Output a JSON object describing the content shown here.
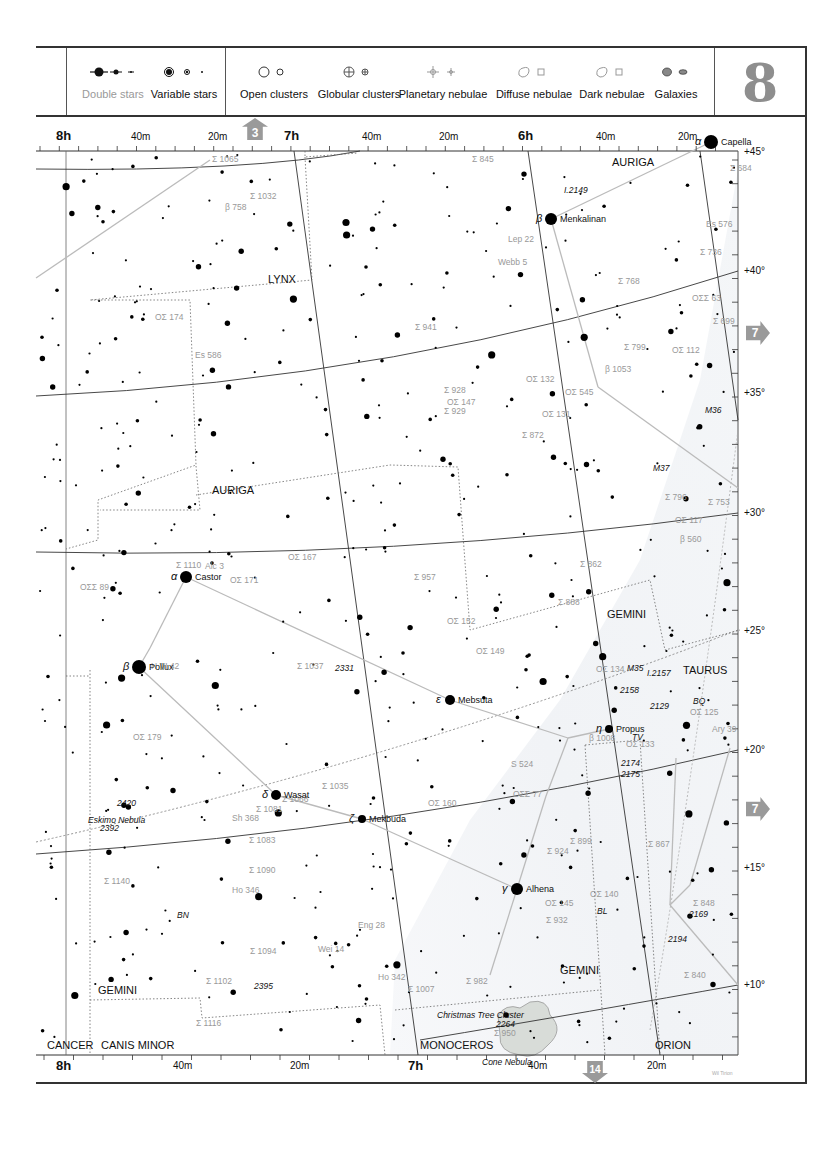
{
  "legend": {
    "items": [
      {
        "label": "Double stars",
        "muted": true,
        "icon": "double-star-icon"
      },
      {
        "label": "Variable stars",
        "muted": false,
        "icon": "variable-star-icon"
      },
      {
        "label": "Open clusters",
        "muted": false,
        "icon": "open-cluster-icon"
      },
      {
        "label": "Globular clusters",
        "muted": false,
        "icon": "globular-cluster-icon"
      },
      {
        "label": "Planetary nebulae",
        "muted": false,
        "icon": "planetary-nebula-icon"
      },
      {
        "label": "Diffuse nebulae",
        "muted": false,
        "icon": "diffuse-nebula-icon"
      },
      {
        "label": "Dark nebulae",
        "muted": false,
        "icon": "dark-nebula-icon"
      },
      {
        "label": "Galaxies",
        "muted": false,
        "icon": "galaxy-icon"
      }
    ],
    "chart_number": "8"
  },
  "navigation": {
    "up": "3",
    "right_top": "7",
    "right_bottom": "7",
    "down": "14"
  },
  "axes": {
    "top": [
      {
        "label": "8h",
        "type": "hour",
        "x": 66
      },
      {
        "label": "40m",
        "type": "minute",
        "x": 141
      },
      {
        "label": "20m",
        "type": "minute",
        "x": 218
      },
      {
        "label": "7h",
        "type": "hour",
        "x": 294
      },
      {
        "label": "40m",
        "type": "minute",
        "x": 372
      },
      {
        "label": "20m",
        "type": "minute",
        "x": 449
      },
      {
        "label": "6h",
        "type": "hour",
        "x": 528
      },
      {
        "label": "40m",
        "type": "minute",
        "x": 606
      },
      {
        "label": "20m",
        "type": "minute",
        "x": 688
      }
    ],
    "bottom": [
      {
        "label": "8h",
        "type": "hour",
        "x": 66
      },
      {
        "label": "40m",
        "type": "minute",
        "x": 183
      },
      {
        "label": "20m",
        "type": "minute",
        "x": 300
      },
      {
        "label": "7h",
        "type": "hour",
        "x": 418
      },
      {
        "label": "40m",
        "type": "minute",
        "x": 538
      },
      {
        "label": "20m",
        "type": "minute",
        "x": 657
      }
    ],
    "right": [
      {
        "label": "+45°",
        "y": 152
      },
      {
        "label": "+40°",
        "y": 271
      },
      {
        "label": "+35°",
        "y": 393
      },
      {
        "label": "+30°",
        "y": 513
      },
      {
        "label": "+25°",
        "y": 631
      },
      {
        "label": "+20°",
        "y": 750
      },
      {
        "label": "+15°",
        "y": 868
      },
      {
        "label": "+10°",
        "y": 985
      }
    ]
  },
  "constellations": [
    {
      "name": "AURIGA",
      "x": 612,
      "y": 162
    },
    {
      "name": "LYNX",
      "x": 268,
      "y": 279
    },
    {
      "name": "AURIGA",
      "x": 212,
      "y": 490
    },
    {
      "name": "GEMINI",
      "x": 607,
      "y": 614
    },
    {
      "name": "TAURUS",
      "x": 683,
      "y": 670
    },
    {
      "name": "GEMINI",
      "x": 560,
      "y": 970
    },
    {
      "name": "GEMINI",
      "x": 98,
      "y": 990
    },
    {
      "name": "CANCER",
      "x": 47,
      "y": 1045
    },
    {
      "name": "CANIS MINOR",
      "x": 101,
      "y": 1045
    },
    {
      "name": "MONOCEROS",
      "x": 420,
      "y": 1045
    },
    {
      "name": "ORION",
      "x": 655,
      "y": 1045
    }
  ],
  "named_stars": [
    {
      "name": "Capella",
      "greek": "α",
      "x": 711,
      "y": 142,
      "r": 7
    },
    {
      "name": "Menkalinan",
      "greek": "β",
      "x": 551,
      "y": 219,
      "r": 6
    },
    {
      "name": "Castor",
      "greek": "α",
      "x": 186,
      "y": 577,
      "r": 6
    },
    {
      "name": "Pollux",
      "greek": "β",
      "x": 139,
      "y": 667,
      "r": 7
    },
    {
      "name": "Mebsuta",
      "greek": "ε",
      "x": 450,
      "y": 700,
      "r": 5
    },
    {
      "name": "Propus",
      "greek": "η",
      "x": 609,
      "y": 729,
      "r": 4
    },
    {
      "name": "Wasat",
      "greek": "δ",
      "x": 276,
      "y": 795,
      "r": 5
    },
    {
      "name": "Mekbuda",
      "greek": "ζ",
      "x": 362,
      "y": 819,
      "r": 4
    },
    {
      "name": "Alhena",
      "greek": "γ",
      "x": 517,
      "y": 889,
      "r": 6
    }
  ],
  "labels": [
    {
      "t": "Σ 1065",
      "x": 212,
      "y": 160,
      "grey": true
    },
    {
      "t": "Σ 845",
      "x": 472,
      "y": 160,
      "grey": true
    },
    {
      "t": "Σ 684",
      "x": 730,
      "y": 169,
      "grey": true
    },
    {
      "t": "I.2149",
      "x": 564,
      "y": 191,
      "grey": false
    },
    {
      "t": "Σ 1032",
      "x": 250,
      "y": 197,
      "grey": true
    },
    {
      "t": "β 758",
      "x": 225,
      "y": 208,
      "grey": true
    },
    {
      "t": "Es 576",
      "x": 706,
      "y": 225,
      "grey": true
    },
    {
      "t": "Lep 22",
      "x": 508,
      "y": 240,
      "grey": true
    },
    {
      "t": "Σ 736",
      "x": 700,
      "y": 253,
      "grey": true
    },
    {
      "t": "Webb 5",
      "x": 498,
      "y": 263,
      "grey": true
    },
    {
      "t": "Σ 768",
      "x": 618,
      "y": 282,
      "grey": true
    },
    {
      "t": "ΟΣΣ 63",
      "x": 692,
      "y": 299,
      "grey": true
    },
    {
      "t": "ΟΣ 174",
      "x": 155,
      "y": 318,
      "grey": true
    },
    {
      "t": "Σ 699",
      "x": 713,
      "y": 322,
      "grey": true
    },
    {
      "t": "Σ 941",
      "x": 415,
      "y": 328,
      "grey": true
    },
    {
      "t": "Σ 799",
      "x": 624,
      "y": 348,
      "grey": true
    },
    {
      "t": "ΟΣ 112",
      "x": 672,
      "y": 351,
      "grey": true
    },
    {
      "t": "Es 586",
      "x": 195,
      "y": 356,
      "grey": true
    },
    {
      "t": "ΟΣ 132",
      "x": 526,
      "y": 380,
      "grey": true
    },
    {
      "t": "β 1053",
      "x": 605,
      "y": 370,
      "grey": true
    },
    {
      "t": "Σ 928",
      "x": 444,
      "y": 391,
      "grey": true
    },
    {
      "t": "ΟΣ 545",
      "x": 565,
      "y": 393,
      "grey": true
    },
    {
      "t": "ΟΣ 147",
      "x": 447,
      "y": 403,
      "grey": true
    },
    {
      "t": "Σ 929",
      "x": 444,
      "y": 412,
      "grey": true
    },
    {
      "t": "ΟΣ 131",
      "x": 542,
      "y": 415,
      "grey": true
    },
    {
      "t": "M36",
      "x": 705,
      "y": 411,
      "grey": false
    },
    {
      "t": "Σ 872",
      "x": 522,
      "y": 436,
      "grey": true
    },
    {
      "t": "M37",
      "x": 653,
      "y": 469,
      "grey": false
    },
    {
      "t": "Σ 796",
      "x": 665,
      "y": 498,
      "grey": true
    },
    {
      "t": "Σ 753",
      "x": 708,
      "y": 503,
      "grey": true
    },
    {
      "t": "ΟΣ 117",
      "x": 675,
      "y": 521,
      "grey": true
    },
    {
      "t": "β 560",
      "x": 680,
      "y": 540,
      "grey": true
    },
    {
      "t": "ΟΣ 167",
      "x": 288,
      "y": 558,
      "grey": true
    },
    {
      "t": "Σ 957",
      "x": 414,
      "y": 578,
      "grey": true
    },
    {
      "t": "Σ 862",
      "x": 580,
      "y": 565,
      "grey": true
    },
    {
      "t": "Σ 1110",
      "x": 176,
      "y": 566,
      "grey": true
    },
    {
      "t": "Alc 3",
      "x": 205,
      "y": 567,
      "grey": true
    },
    {
      "t": "ΟΣ 171",
      "x": 230,
      "y": 581,
      "grey": true
    },
    {
      "t": "ΟΣΣ 89",
      "x": 80,
      "y": 588,
      "grey": true
    },
    {
      "t": "Σ 888",
      "x": 558,
      "y": 603,
      "grey": true
    },
    {
      "t": "ΟΣ 152",
      "x": 447,
      "y": 622,
      "grey": true
    },
    {
      "t": "ΟΣ 149",
      "x": 476,
      "y": 652,
      "grey": true
    },
    {
      "t": "M35",
      "x": 627,
      "y": 669,
      "grey": false
    },
    {
      "t": "ΟΣ 134",
      "x": 596,
      "y": 670,
      "grey": true
    },
    {
      "t": "I.2157",
      "x": 647,
      "y": 674,
      "grey": false
    },
    {
      "t": "H VI 42",
      "x": 151,
      "y": 667,
      "grey": true
    },
    {
      "t": "Σ 1037",
      "x": 297,
      "y": 667,
      "grey": true
    },
    {
      "t": "2331",
      "x": 335,
      "y": 669,
      "grey": false
    },
    {
      "t": "2158",
      "x": 620,
      "y": 691,
      "grey": false
    },
    {
      "t": "2129",
      "x": 650,
      "y": 707,
      "grey": false
    },
    {
      "t": "BQ",
      "x": 693,
      "y": 702,
      "grey": false
    },
    {
      "t": "ΟΣ 125",
      "x": 690,
      "y": 713,
      "grey": true
    },
    {
      "t": "β 1008",
      "x": 589,
      "y": 739,
      "grey": true
    },
    {
      "t": "TV",
      "x": 632,
      "y": 738,
      "grey": false
    },
    {
      "t": "ΟΣ 179",
      "x": 133,
      "y": 738,
      "grey": true
    },
    {
      "t": "ΟΣ 133",
      "x": 626,
      "y": 745,
      "grey": true
    },
    {
      "t": "Ary 39",
      "x": 712,
      "y": 730,
      "grey": true
    },
    {
      "t": "S 524",
      "x": 511,
      "y": 765,
      "grey": true
    },
    {
      "t": "2174",
      "x": 621,
      "y": 764,
      "grey": false
    },
    {
      "t": "2175",
      "x": 621,
      "y": 775,
      "grey": false
    },
    {
      "t": "Σ 1035",
      "x": 322,
      "y": 787,
      "grey": true
    },
    {
      "t": "ΟΣΣ 77",
      "x": 513,
      "y": 795,
      "grey": true
    },
    {
      "t": "ΟΣ 160",
      "x": 428,
      "y": 804,
      "grey": true
    },
    {
      "t": "Σ 1066",
      "x": 282,
      "y": 800,
      "grey": true
    },
    {
      "t": "2420",
      "x": 117,
      "y": 804,
      "grey": false
    },
    {
      "t": "Eskimo Nebula",
      "x": 88,
      "y": 821,
      "grey": false
    },
    {
      "t": "Σ 1081",
      "x": 256,
      "y": 810,
      "grey": true
    },
    {
      "t": "Sh 368",
      "x": 232,
      "y": 819,
      "grey": true
    },
    {
      "t": "2392",
      "x": 100,
      "y": 829,
      "grey": false
    },
    {
      "t": "Σ 1083",
      "x": 249,
      "y": 841,
      "grey": true
    },
    {
      "t": "Σ 899",
      "x": 570,
      "y": 842,
      "grey": true
    },
    {
      "t": "Σ 867",
      "x": 648,
      "y": 845,
      "grey": true
    },
    {
      "t": "Σ 924",
      "x": 547,
      "y": 852,
      "grey": true
    },
    {
      "t": "Σ 1090",
      "x": 249,
      "y": 871,
      "grey": true
    },
    {
      "t": "Σ 1140",
      "x": 104,
      "y": 882,
      "grey": true
    },
    {
      "t": "ΟΣ 140",
      "x": 590,
      "y": 895,
      "grey": true
    },
    {
      "t": "Ho 346",
      "x": 232,
      "y": 891,
      "grey": true
    },
    {
      "t": "ΟΣ 145",
      "x": 545,
      "y": 904,
      "grey": true
    },
    {
      "t": "Σ 848",
      "x": 693,
      "y": 904,
      "grey": true
    },
    {
      "t": "2169",
      "x": 689,
      "y": 915,
      "grey": false
    },
    {
      "t": "BN",
      "x": 177,
      "y": 916,
      "grey": false
    },
    {
      "t": "BL",
      "x": 597,
      "y": 912,
      "grey": false
    },
    {
      "t": "Σ 932",
      "x": 546,
      "y": 921,
      "grey": true
    },
    {
      "t": "Eng 28",
      "x": 358,
      "y": 926,
      "grey": true
    },
    {
      "t": "Σ 1094",
      "x": 250,
      "y": 952,
      "grey": true
    },
    {
      "t": "Wei 14",
      "x": 318,
      "y": 950,
      "grey": true
    },
    {
      "t": "2194",
      "x": 668,
      "y": 940,
      "grey": false
    },
    {
      "t": "Σ 1102",
      "x": 206,
      "y": 982,
      "grey": true
    },
    {
      "t": "2395",
      "x": 254,
      "y": 987,
      "grey": false
    },
    {
      "t": "Ho 342",
      "x": 378,
      "y": 978,
      "grey": true
    },
    {
      "t": "Σ 1007",
      "x": 408,
      "y": 990,
      "grey": true
    },
    {
      "t": "Σ 982",
      "x": 466,
      "y": 982,
      "grey": true
    },
    {
      "t": "Σ 840",
      "x": 684,
      "y": 976,
      "grey": true
    },
    {
      "t": "Σ 1116",
      "x": 196,
      "y": 1024,
      "grey": true
    },
    {
      "t": "Christmas Tree Cluster",
      "x": 437,
      "y": 1016,
      "grey": false
    },
    {
      "t": "2264",
      "x": 496,
      "y": 1025,
      "grey": false
    },
    {
      "t": "Σ 950",
      "x": 494,
      "y": 1034,
      "grey": true
    },
    {
      "t": "Cone Nebula",
      "x": 482,
      "y": 1063,
      "grey": false
    }
  ],
  "galactic_equator": {
    "label": "Galactic Equator",
    "marks": [
      "180°",
      "90°",
      "100°",
      "110°"
    ]
  },
  "credit": "Wil Tirion"
}
